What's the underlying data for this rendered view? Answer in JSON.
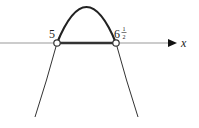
{
  "diagram": {
    "type": "parabola-sign-diagram",
    "axis": {
      "label": "x"
    },
    "roots": [
      {
        "label": "5",
        "value": 5
      },
      {
        "label_whole": "6",
        "label_num": "1",
        "label_den": "2",
        "value": 6.5
      }
    ],
    "interval_highlight": {
      "from": 5,
      "to": 6.5,
      "note": "thick segment between open circles"
    },
    "curve": {
      "opens": "down",
      "bold_above_axis": true
    },
    "colors": {
      "line": "#222222",
      "axis": "#888888",
      "highlight": "#333333"
    }
  }
}
